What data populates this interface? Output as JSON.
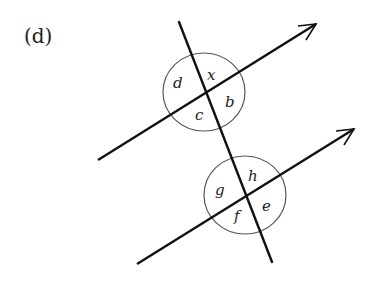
{
  "part_label": "(d)",
  "diagram": {
    "upper_intersection": {
      "angles": {
        "top": "x",
        "left": "d",
        "right": "b",
        "bottom": "c"
      }
    },
    "lower_intersection": {
      "angles": {
        "top": "h",
        "left": "g",
        "right": "e",
        "bottom": "f"
      }
    },
    "colors": {
      "stroke": "#111111",
      "circle": "#555555",
      "text": "#222222"
    }
  }
}
